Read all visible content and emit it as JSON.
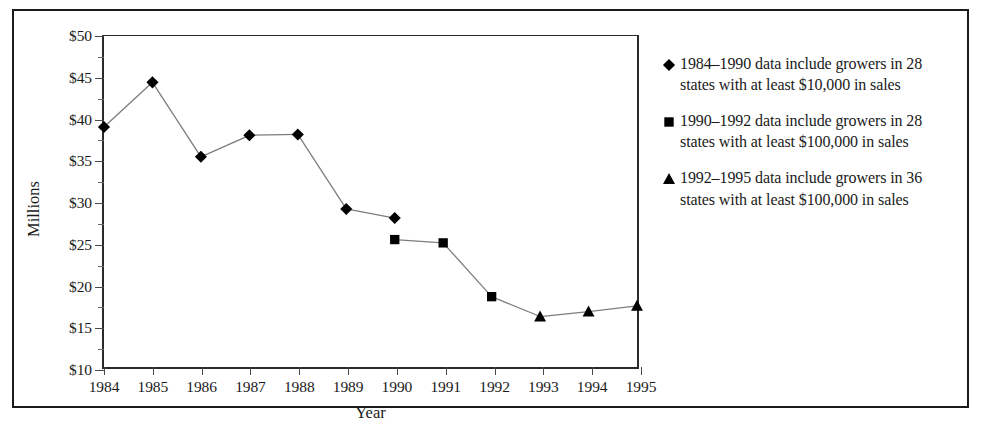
{
  "chart_data": {
    "type": "line",
    "title": "",
    "subtitle": "",
    "xlabel": "Year",
    "ylabel": "Millions",
    "x": [
      1984,
      1985,
      1986,
      1987,
      1988,
      1989,
      1990,
      1991,
      1992,
      1993,
      1994,
      1995
    ],
    "xlim": [
      1984,
      1995
    ],
    "ylim": [
      10,
      50
    ],
    "ytick_values": [
      10,
      15,
      20,
      25,
      30,
      35,
      40,
      45,
      50
    ],
    "ytick_labels": [
      "$10",
      "$15",
      "$20",
      "$25",
      "$30",
      "$35",
      "$40",
      "$45",
      "$50"
    ],
    "yminor_values": [
      12.5,
      17.5,
      22.5,
      27.5,
      32.5,
      37.5,
      42.5,
      47.5
    ],
    "xtick_labels": [
      "1984",
      "1985",
      "1986",
      "1987",
      "1988",
      "1989",
      "1990",
      "1991",
      "1992",
      "1993",
      "1994",
      "1995"
    ],
    "grid": false,
    "legend_position": "right",
    "series": [
      {
        "name": "1984–1990 data include growers in 28 states with at least $10,000 in sales",
        "marker": "diamond",
        "color": "#000000",
        "points": [
          {
            "x": 1984,
            "y": 39.0
          },
          {
            "x": 1985,
            "y": 44.4
          },
          {
            "x": 1986,
            "y": 35.4
          },
          {
            "x": 1987,
            "y": 38.0
          },
          {
            "x": 1988,
            "y": 38.1
          },
          {
            "x": 1989,
            "y": 29.1
          },
          {
            "x": 1990,
            "y": 28.0
          }
        ]
      },
      {
        "name": "1990–1992 data include growers in 28 states with at least $100,000 in sales",
        "marker": "square",
        "color": "#000000",
        "points": [
          {
            "x": 1990,
            "y": 25.4
          },
          {
            "x": 1991,
            "y": 25.0
          },
          {
            "x": 1992,
            "y": 18.5
          }
        ]
      },
      {
        "name": "1992–1995 data include growers in 36 states with at least $100,000 in sales",
        "marker": "triangle",
        "color": "#000000",
        "points": [
          {
            "x": 1993,
            "y": 16.1
          },
          {
            "x": 1994,
            "y": 16.7
          },
          {
            "x": 1995,
            "y": 17.4
          }
        ]
      }
    ],
    "connector_segments": [
      {
        "from": {
          "x": 1992,
          "y": 18.5
        },
        "to": {
          "x": 1993,
          "y": 16.1
        }
      }
    ]
  },
  "axes": {
    "y_title": "Millions",
    "x_title": "Year"
  },
  "legend": {
    "entries": [
      {
        "marker": "diamond",
        "marker_name": "diamond-marker-icon",
        "text": "1984–1990 data include growers in 28 states with at least $10,000 in sales"
      },
      {
        "marker": "square",
        "marker_name": "square-marker-icon",
        "text": "1990–1992 data include growers in 28 states with at least $100,000 in sales"
      },
      {
        "marker": "triangle",
        "marker_name": "triangle-marker-icon",
        "text": "1992–1995 data include growers in 36 states with at least $100,000 in sales"
      }
    ]
  },
  "colors": {
    "marker": "#000000",
    "line": "#7d7d7d",
    "axis": "#2a2a2a",
    "border": "#1b1b1b",
    "text": "#1a1a1a",
    "background": "#ffffff"
  }
}
